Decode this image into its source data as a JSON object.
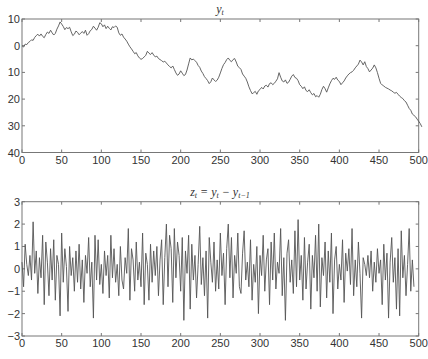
{
  "chart_data": [
    {
      "type": "line",
      "title": "y_t",
      "title_main": "y",
      "title_sub": "t",
      "xlabel": "",
      "ylabel": "",
      "xlim": [
        0,
        500
      ],
      "ylim": [
        -40,
        10
      ],
      "xticks": [
        0,
        50,
        100,
        150,
        200,
        250,
        300,
        350,
        400,
        450,
        500
      ],
      "yticks": [
        10,
        0,
        -10,
        -20,
        -30,
        -40
      ],
      "ytick_labels": [
        "10",
        "0",
        "10",
        "20",
        "30",
        "40"
      ],
      "grid": false,
      "x_step": 2,
      "series": [
        {
          "name": "y_t",
          "color": "#555555",
          "values": [
            0,
            -0.5,
            0.6,
            0.4,
            1.2,
            1.6,
            2.2,
            2.0,
            3.1,
            3.8,
            4.3,
            3.6,
            4.4,
            3.5,
            3.0,
            4.2,
            5.1,
            4.6,
            5.8,
            4.8,
            4.0,
            4.6,
            6.2,
            7.4,
            8.9,
            8.1,
            7.2,
            6.0,
            6.8,
            6.4,
            6.9,
            5.2,
            3.8,
            4.3,
            5.5,
            5.0,
            4.1,
            4.7,
            5.3,
            4.6,
            5.8,
            3.9,
            4.5,
            5.6,
            6.1,
            7.3,
            6.6,
            5.8,
            6.9,
            8.6,
            8.2,
            7.1,
            7.8,
            6.4,
            7.3,
            6.5,
            5.9,
            7.1,
            6.8,
            7.4,
            6.9,
            4.8,
            3.9,
            4.4,
            3.2,
            2.5,
            1.7,
            0.6,
            -0.4,
            -1.2,
            -2.1,
            -3.0,
            -2.6,
            -3.8,
            -4.6,
            -5.1,
            -4.8,
            -4.2,
            -3.6,
            -2.1,
            -2.8,
            -3.3,
            -2.6,
            -3.5,
            -4.2,
            -3.9,
            -4.8,
            -5.2,
            -5.6,
            -6.1,
            -5.8,
            -6.5,
            -7.2,
            -7.8,
            -8.3,
            -7.6,
            -8.9,
            -10.2,
            -11.1,
            -10.6,
            -9.4,
            -10.3,
            -11.2,
            -10.8,
            -9.1,
            -6.8,
            -4.6,
            -5.3,
            -5.0,
            -5.6,
            -6.2,
            -7.4,
            -8.1,
            -9.5,
            -10.4,
            -11.6,
            -12.3,
            -13.1,
            -14.2,
            -13.5,
            -12.1,
            -12.8,
            -13.4,
            -12.9,
            -11.8,
            -10.2,
            -8.5,
            -7.1,
            -6.3,
            -5.2,
            -4.6,
            -5.5,
            -6.0,
            -5.2,
            -4.8,
            -6.1,
            -7.7,
            -8.2,
            -8.9,
            -10.6,
            -11.4,
            -12.2,
            -13.6,
            -15.4,
            -16.8,
            -18.0,
            -17.6,
            -17.1,
            -18.2,
            -16.9,
            -16.4,
            -15.6,
            -16.2,
            -15.1,
            -14.8,
            -15.5,
            -14.2,
            -13.9,
            -14.6,
            -14.1,
            -13.3,
            -12.4,
            -10.1,
            -11.8,
            -13.2,
            -13.6,
            -12.8,
            -14.1,
            -13.7,
            -12.6,
            -11.4,
            -10.8,
            -11.9,
            -12.2,
            -13.1,
            -14.6,
            -15.2,
            -16.1,
            -15.4,
            -16.8,
            -17.2,
            -16.5,
            -17.6,
            -18.4,
            -17.9,
            -19.1,
            -18.7,
            -19.3,
            -18.2,
            -16.4,
            -15.2,
            -16.1,
            -17.4,
            -15.8,
            -14.3,
            -13.1,
            -12.2,
            -12.6,
            -11.8,
            -12.9,
            -13.4,
            -14.6,
            -13.9,
            -13.2,
            -12.1,
            -11.3,
            -10.6,
            -10.1,
            -9.8,
            -9.2,
            -8.3,
            -7.6,
            -6.9,
            -5.4,
            -6.1,
            -7.2,
            -6.0,
            -7.8,
            -8.6,
            -9.8,
            -9.1,
            -8.4,
            -7.2,
            -8.3,
            -10.1,
            -12.2,
            -14.1,
            -14.7,
            -15.1,
            -15.6,
            -15.9,
            -16.2,
            -16.6,
            -16.9,
            -17.4,
            -17.8,
            -17.5,
            -18.2,
            -18.9,
            -19.4,
            -19.8,
            -20.6,
            -21.1,
            -22.3,
            -23.5,
            -24.2,
            -25.6,
            -26.1,
            -26.6,
            -27.5,
            -28.3,
            -29.2,
            -30.4
          ]
        }
      ]
    },
    {
      "type": "line",
      "title": "z_t = y_t − y_{t−1}",
      "xlabel": "",
      "ylabel": "",
      "xlim": [
        0,
        500
      ],
      "ylim": [
        -3,
        3
      ],
      "xticks": [
        0,
        50,
        100,
        150,
        200,
        250,
        300,
        350,
        400,
        450,
        500
      ],
      "yticks": [
        3,
        2,
        1,
        0,
        -1,
        -2,
        -3
      ],
      "ytick_labels": [
        "3",
        "2",
        "1",
        "0",
        "−1",
        "−2",
        "−3"
      ],
      "grid": false,
      "x_step": 2,
      "series": [
        {
          "name": "z_t",
          "color": "#555555",
          "values": [
            0.3,
            -0.8,
            1.1,
            0.2,
            -0.3,
            0.6,
            -0.5,
            2.1,
            -0.2,
            0.8,
            -1.1,
            0.5,
            -0.4,
            1.5,
            -1.6,
            1.2,
            0.3,
            -1.2,
            0.9,
            -0.5,
            1.3,
            -1.4,
            0.6,
            0.2,
            -2.1,
            1.6,
            -0.6,
            0.9,
            0.1,
            -1.9,
            1.0,
            -0.3,
            0.5,
            -1.0,
            0.8,
            -0.6,
            1.1,
            -0.9,
            0.4,
            -1.5,
            0.6,
            -0.2,
            1.4,
            -0.8,
            0.3,
            -2.2,
            1.5,
            -0.5,
            1.3,
            -0.7,
            0.2,
            -1.1,
            0.8,
            -0.3,
            0.6,
            -1.3,
            1.5,
            -0.4,
            0.9,
            -0.6,
            0.2,
            -1.2,
            1.0,
            -0.5,
            -0.9,
            0.5,
            -0.2,
            1.8,
            -1.4,
            0.9,
            0.4,
            -1.0,
            1.2,
            -0.5,
            0.3,
            -0.8,
            1.6,
            -1.6,
            0.7,
            0.2,
            -1.4,
            1.1,
            -0.6,
            0.8,
            -0.3,
            1.0,
            -1.2,
            0.4,
            1.3,
            -1.6,
            0.5,
            2.0,
            -0.8,
            1.5,
            0.9,
            -1.5,
            1.8,
            -0.4,
            1.2,
            0.6,
            -1.0,
            1.4,
            -2.3,
            0.8,
            -0.2,
            1.5,
            -1.8,
            1.1,
            -0.5,
            0.6,
            -1.3,
            0.2,
            1.9,
            -0.7,
            0.5,
            -1.2,
            0.8,
            -2.2,
            1.4,
            0.3,
            -0.6,
            1.2,
            -1.0,
            0.4,
            -0.9,
            1.6,
            -0.3,
            0.7,
            -1.6,
            0.9,
            2.0,
            -0.4,
            1.4,
            -1.3,
            0.6,
            -0.2,
            1.6,
            -0.8,
            -1.1,
            0.7,
            1.7,
            -0.5,
            0.3,
            -0.8,
            1.3,
            -1.4,
            0.2,
            -0.6,
            1.0,
            -2.0,
            0.6,
            -0.3,
            1.5,
            -1.0,
            0.4,
            0.9,
            -1.6,
            1.2,
            -0.5,
            1.6,
            -0.9,
            0.3,
            -0.2,
            1.8,
            -1.2,
            0.5,
            -2.3,
            0.7,
            1.3,
            -0.6,
            0.4,
            -1.1,
            1.7,
            -0.8,
            2.2,
            -0.5,
            0.6,
            -1.4,
            1.4,
            -0.9,
            0.3,
            1.1,
            -1.8,
            0.6,
            -0.4,
            1.5,
            -1.0,
            2.0,
            -1.7,
            0.5,
            -0.3,
            1.2,
            -1.3,
            0.8,
            -0.6,
            1.6,
            -2.0,
            0.4,
            1.0,
            -0.9,
            0.2,
            -0.5,
            1.3,
            -1.5,
            0.7,
            -0.1,
            0.9,
            -0.7,
            1.8,
            -1.2,
            0.4,
            -0.8,
            1.2,
            -0.2,
            -2.2,
            0.5,
            0.2,
            -0.3,
            0.6,
            -0.4,
            0.8,
            -1.0,
            0.3,
            -0.6,
            0.9,
            -0.2,
            0.4,
            -1.6,
            1.1,
            -0.5,
            0.7,
            -2.2,
            0.3,
            1.4,
            -0.6,
            0.5,
            -1.8,
            0.9,
            -2.1,
            1.7,
            -0.4,
            0.6,
            -1.2,
            0.2,
            1.8,
            -1.0,
            0.4,
            -0.8
          ]
        }
      ]
    }
  ]
}
